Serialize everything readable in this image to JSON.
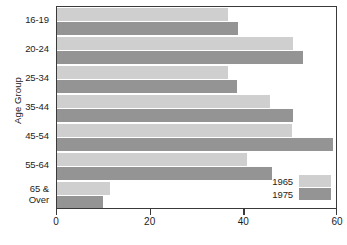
{
  "chart_data": {
    "type": "bar",
    "orientation": "horizontal",
    "title": "",
    "xlabel": "",
    "ylabel": "Age Group",
    "categories": [
      "16-19",
      "20-24",
      "25-34",
      "35-44",
      "45-54",
      "55-64",
      "65 &\nOver"
    ],
    "category_labels": [
      {
        "lines": [
          "16-19"
        ]
      },
      {
        "lines": [
          "20-24"
        ]
      },
      {
        "lines": [
          "25-34"
        ]
      },
      {
        "lines": [
          "35-44"
        ]
      },
      {
        "lines": [
          "45-54"
        ]
      },
      {
        "lines": [
          "55-64"
        ]
      },
      {
        "lines": [
          "65 &",
          "Over"
        ]
      }
    ],
    "series": [
      {
        "name": "1965",
        "color": "#cfcfcf",
        "values": [
          36.5,
          50.3,
          36.5,
          45.4,
          50.1,
          40.6,
          11.4
        ]
      },
      {
        "name": "1975",
        "color": "#949494",
        "values": [
          38.7,
          52.5,
          38.5,
          50.3,
          58.9,
          46.0,
          9.9
        ]
      }
    ],
    "xlim": [
      0,
      60
    ],
    "xticks": [
      0,
      20,
      40,
      60
    ],
    "xtick_labels": [
      "0",
      "20",
      "40",
      "60"
    ],
    "grid": false,
    "legend_position": "lower-right",
    "legend_entries": [
      {
        "label": "1965",
        "color": "#cfcfcf"
      },
      {
        "label": "1975",
        "color": "#949494"
      }
    ],
    "frame_color": "#3a3a3a",
    "background": "#ffffff"
  }
}
